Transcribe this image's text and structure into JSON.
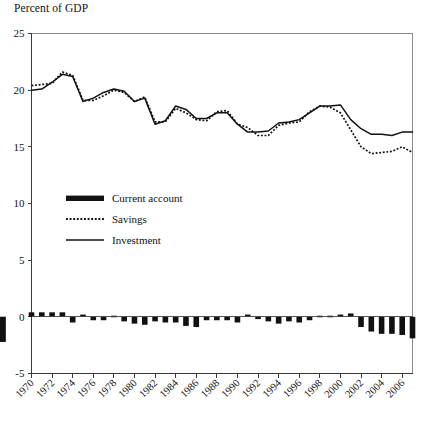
{
  "chart_title": "Percent of GDP",
  "legend": {
    "items": [
      {
        "label": "Current account",
        "style": "bar"
      },
      {
        "label": "Savings",
        "style": "dotted"
      },
      {
        "label": "Investment",
        "style": "solid"
      }
    ]
  },
  "axes": {
    "y_ticks": [
      "25",
      "20",
      "15",
      "10",
      "5",
      "0",
      "-5"
    ],
    "x_ticks": [
      "1970",
      "1972",
      "1974",
      "1976",
      "1978",
      "1980",
      "1982",
      "1984",
      "1986",
      "1988",
      "1990",
      "1992",
      "1994",
      "1996",
      "1998",
      "2000",
      "2002",
      "2004",
      "2006"
    ]
  },
  "colors": {
    "ink": "#111111",
    "frame": "#8a8a8a",
    "axis": "#3a3a3a",
    "background": "#ffffff"
  },
  "chart_data": {
    "type": "line",
    "title": "Percent of GDP",
    "xlabel": "",
    "ylabel": "Percent of GDP",
    "ylim": [
      -5,
      25
    ],
    "xlim": [
      1970,
      2007
    ],
    "grid": false,
    "legend_position": "inside-left-middle",
    "x": [
      1970,
      1971,
      1972,
      1973,
      1974,
      1975,
      1976,
      1977,
      1978,
      1979,
      1980,
      1981,
      1982,
      1983,
      1984,
      1985,
      1986,
      1987,
      1988,
      1989,
      1990,
      1991,
      1992,
      1993,
      1994,
      1995,
      1996,
      1997,
      1998,
      1999,
      2000,
      2001,
      2002,
      2003,
      2004,
      2005,
      2006,
      2007
    ],
    "series": [
      {
        "name": "Savings",
        "style": "dotted",
        "values": [
          20.4,
          20.5,
          20.6,
          21.6,
          21.3,
          19.1,
          19.1,
          19.5,
          20.0,
          19.8,
          19.0,
          19.4,
          17.2,
          17.2,
          18.4,
          18.0,
          17.4,
          17.3,
          18.1,
          18.2,
          17.0,
          16.7,
          16.0,
          16.0,
          16.9,
          17.1,
          17.2,
          18.1,
          18.6,
          18.5,
          18.0,
          16.5,
          15.0,
          14.4,
          14.5,
          14.6,
          15.0,
          14.5
        ]
      },
      {
        "name": "Investment",
        "style": "solid",
        "values": [
          20.0,
          20.1,
          20.7,
          21.4,
          21.2,
          19.0,
          19.3,
          19.8,
          20.1,
          19.9,
          19.0,
          19.3,
          17.0,
          17.3,
          18.6,
          18.3,
          17.5,
          17.5,
          18.0,
          18.0,
          17.0,
          16.3,
          16.3,
          16.4,
          17.1,
          17.2,
          17.4,
          18.0,
          18.6,
          18.6,
          18.7,
          17.4,
          16.6,
          16.1,
          16.1,
          16.0,
          16.3,
          16.3
        ]
      }
    ],
    "bar_series": {
      "name": "Current account",
      "style": "bar",
      "values": [
        0.4,
        0.4,
        0.4,
        0.4,
        -0.5,
        0.2,
        -0.3,
        -0.3,
        0.1,
        -0.4,
        -0.6,
        -0.7,
        -0.4,
        -0.5,
        -0.5,
        -0.8,
        -0.9,
        -0.3,
        -0.3,
        -0.3,
        -0.5,
        0.2,
        -0.2,
        -0.4,
        -0.6,
        -0.4,
        -0.5,
        -0.3,
        0.1,
        0.1,
        0.2,
        0.3,
        -0.9,
        -1.3,
        -1.5,
        -1.5,
        -1.6,
        -1.9,
        -2.2,
        -2.2
      ]
    }
  }
}
